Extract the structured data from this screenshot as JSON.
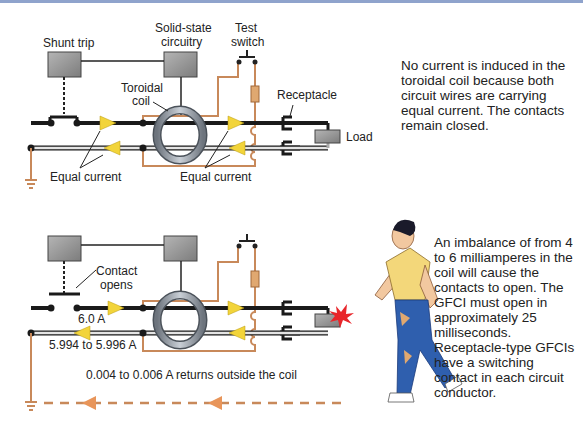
{
  "figure": {
    "colors": {
      "hot_wire": "#1a1a1a",
      "neutral_wire": "#d8d8d8",
      "ground_wire": "#c8895a",
      "arrow_fill": "#f2d43a",
      "ground_arrow": "#e8955a",
      "box_fill": "#9a9a9a",
      "coil": "#8e96a0",
      "shirt": "#f3d77a",
      "pants": "#2f5fae",
      "spark": "#e8252a",
      "top_border": "#8fa3cc"
    }
  },
  "top_panel": {
    "labels": {
      "shunt_trip": "Shunt trip",
      "solid_state_line1": "Solid-state",
      "solid_state_line2": "circuitry",
      "test_line1": "Test",
      "test_line2": "switch",
      "toroidal_line1": "Toroidal",
      "toroidal_line2": "coil",
      "receptacle": "Receptacle",
      "load": "Load",
      "equal_current_left": "Equal current",
      "equal_current_right": "Equal current"
    },
    "description_lines": [
      "No current is induced in the",
      "toroidal coil because both",
      "circuit wires are carrying",
      "equal current. The contacts",
      "remain closed."
    ]
  },
  "bottom_panel": {
    "labels": {
      "contact_line1": "Contact",
      "contact_line2": "opens",
      "hot_current": "6.0 A",
      "neutral_current": "5.994 to 5.996 A",
      "leak_current": "0.004 to 0.006 A returns outside the coil"
    },
    "description_lines": [
      "An imbalance of from 4",
      "to 6 milliamperes in the",
      "coil will cause the",
      "contacts to open. The",
      "GFCI must open in",
      "approximately 25",
      "milliseconds.",
      "Receptacle-type GFCIs",
      "have a switching",
      "contact in each circuit",
      "conductor."
    ]
  }
}
